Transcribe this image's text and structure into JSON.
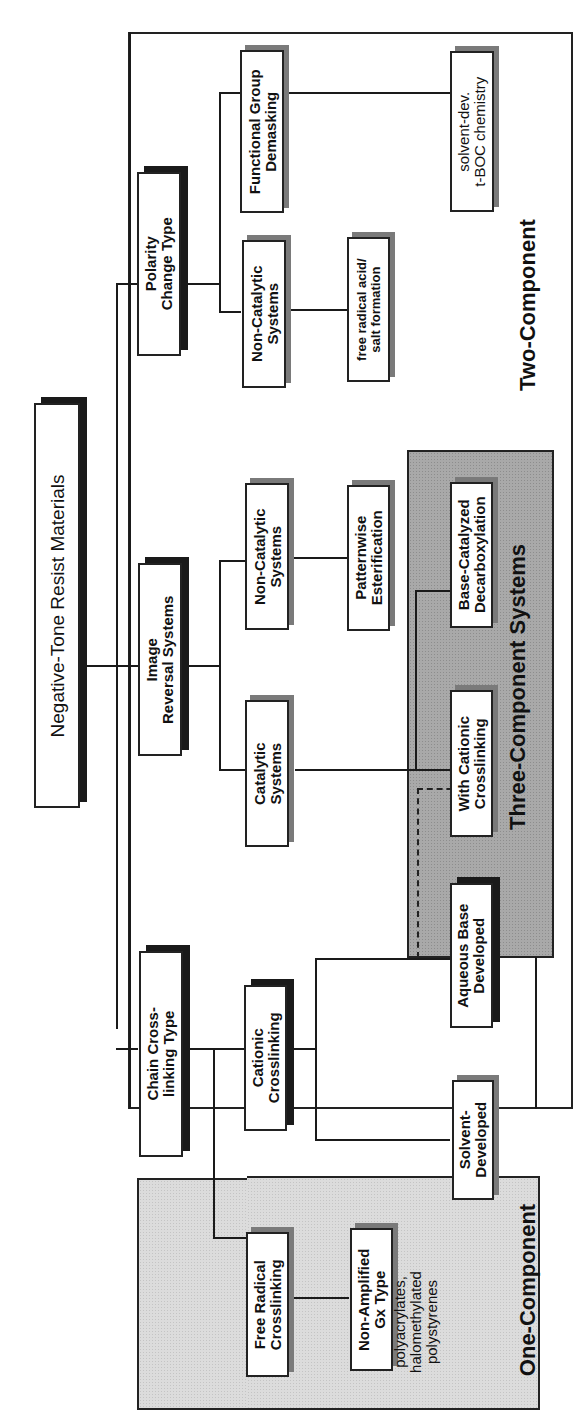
{
  "diagram": {
    "root": {
      "label": "Negative-Tone Resist Materials"
    },
    "categories": {
      "chain_crosslinking": {
        "lines": [
          "Chain Cross-",
          "linking Type"
        ]
      },
      "image_reversal": {
        "lines": [
          "Image",
          "Reversal Systems"
        ]
      },
      "polarity_change": {
        "lines": [
          "Polarity",
          "Change Type"
        ]
      }
    },
    "subcategories": {
      "free_radical": {
        "lines": [
          "Free Radical",
          "Crosslinking"
        ]
      },
      "cationic": {
        "lines": [
          "Cationic",
          "Crosslinking"
        ]
      },
      "ir_catalytic": {
        "lines": [
          "Catalytic",
          "Systems"
        ]
      },
      "ir_noncatalytic": {
        "lines": [
          "Non-Catalytic",
          "Systems"
        ]
      },
      "pc_noncatalytic": {
        "lines": [
          "Non-Catalytic",
          "Systems"
        ]
      },
      "functional_group": {
        "lines": [
          "Functional Group",
          "Demasking"
        ]
      }
    },
    "leaves": {
      "non_amplified": {
        "lines": [
          "Non-Amplified",
          "Gx Type"
        ]
      },
      "solvent_developed": {
        "lines": [
          "Solvent-",
          "Developed"
        ]
      },
      "aqueous_base": {
        "lines": [
          "Aqueous Base",
          "Developed"
        ]
      },
      "with_cationic": {
        "lines": [
          "With Cationic",
          "Crosslinking"
        ]
      },
      "base_catalyzed": {
        "lines": [
          "Base-Catalyzed",
          "Decarboxylation"
        ]
      },
      "patternwise": {
        "lines": [
          "Patternwise",
          "Esterification"
        ]
      },
      "free_radical_acid": {
        "lines": [
          "free radical acid/",
          "salt formation"
        ]
      },
      "tboc": {
        "lines": [
          "solvent-dev.",
          "t-BOC chemistry"
        ]
      }
    },
    "notes": {
      "non_amplified_examples": {
        "lines": [
          "polyacrylates,",
          "halomethylated",
          "polystyrenes"
        ]
      }
    },
    "regions": {
      "one_component": "One-Component",
      "two_component": "Two-Component",
      "three_component": "Three-Component  Systems"
    },
    "colors": {
      "line": "#1a1a1a",
      "one_component_fill": "#dcdcdc",
      "three_component_fill": "#a9a9a9",
      "box_fill": "#ffffff"
    }
  }
}
